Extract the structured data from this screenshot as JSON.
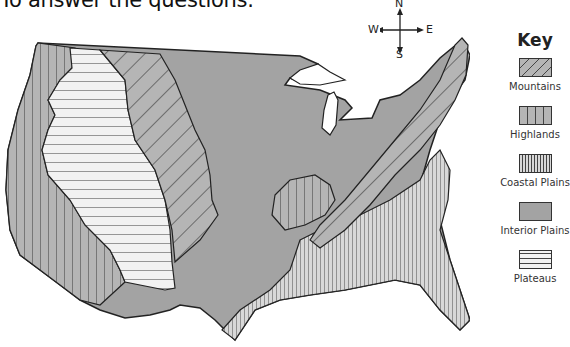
{
  "header": {
    "text": "To answer the questions."
  },
  "compass": {
    "north": "N",
    "south": "S",
    "east": "E",
    "west": "W"
  },
  "key": {
    "title": "Key",
    "items": [
      {
        "label": "Mountains",
        "pattern": "diagonal-hatch",
        "color": "#b5b5b5"
      },
      {
        "label": "Highlands",
        "pattern": "wide-vertical-lines",
        "color": "#b5b5b5"
      },
      {
        "label": "Coastal Plains",
        "pattern": "dense-vertical-lines",
        "color": "#d8d8d8"
      },
      {
        "label": "Interior Plains",
        "pattern": "solid",
        "color": "#a3a3a3"
      },
      {
        "label": "Plateaus",
        "pattern": "horizontal-lines",
        "color": "#f2f2f2"
      }
    ]
  },
  "map": {
    "subject": "Landform regions of the contiguous United States",
    "regions": [
      "Highlands (west coast)",
      "Plateaus",
      "Mountains (Rockies)",
      "Interior Plains",
      "Highlands (Ozarks)",
      "Mountains (Appalachians)",
      "Coastal Plains"
    ]
  }
}
